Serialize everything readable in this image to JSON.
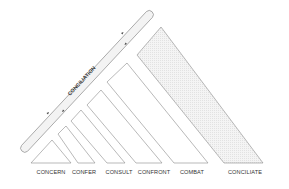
{
  "diagram": {
    "type": "conflict-escalation-triangle",
    "bar": {
      "label": "CONCILIATION",
      "arrows": [
        "up-right",
        "down-left"
      ]
    },
    "stages": [
      {
        "label": "CONCERN",
        "shape": "triangle",
        "x": 51
      },
      {
        "label": "CONFER",
        "shape": "strip",
        "x": 84
      },
      {
        "label": "CONSULT",
        "shape": "strip",
        "x": 119
      },
      {
        "label": "CONFRONT",
        "shape": "strip",
        "x": 154
      },
      {
        "label": "COMBAT",
        "shape": "strip",
        "x": 192
      },
      {
        "label": "CONCILIATE",
        "shape": "strip-shaded",
        "x": 245
      }
    ],
    "colors": {
      "stroke": "#8a8a8a",
      "shade": "#ececec",
      "bar_fill": "#f2f2f2",
      "text": "#333333"
    }
  }
}
